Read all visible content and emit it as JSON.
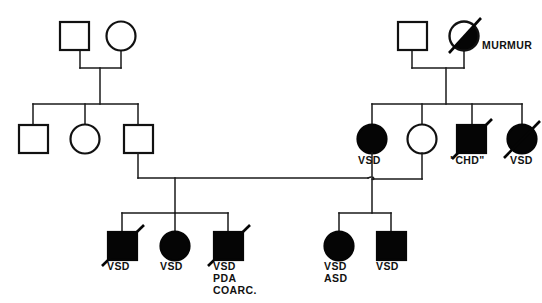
{
  "figure": {
    "type": "pedigree-chart",
    "title": "",
    "width": 542,
    "height": 303,
    "background_color": "#ffffff",
    "line_color": "#1a1a1a",
    "filled_color": "#050505"
  },
  "legend_terms": {
    "vsd": "VSD",
    "asd": "ASD",
    "pda": "PDA",
    "coarc": "COARC.",
    "chd": "\"CHD\"",
    "murmur": "MURMUR"
  },
  "generations": [
    {
      "id": "I",
      "individuals": [
        {
          "id": "I-1",
          "sex": "male",
          "shape": "square",
          "affected": "unaffected",
          "deceased": false,
          "label": ""
        },
        {
          "id": "I-2",
          "sex": "female",
          "shape": "circle",
          "affected": "unaffected",
          "deceased": false,
          "label": ""
        },
        {
          "id": "I-3",
          "sex": "male",
          "shape": "square",
          "affected": "unaffected",
          "deceased": false,
          "label": ""
        },
        {
          "id": "I-4",
          "sex": "female",
          "shape": "circle",
          "affected": "half-filled",
          "deceased": true,
          "label": "MURMUR"
        }
      ]
    },
    {
      "id": "II",
      "individuals": [
        {
          "id": "II-1",
          "sex": "male",
          "shape": "square",
          "affected": "unaffected",
          "deceased": false,
          "label": ""
        },
        {
          "id": "II-2",
          "sex": "female",
          "shape": "circle",
          "affected": "unaffected",
          "deceased": false,
          "label": ""
        },
        {
          "id": "II-3",
          "sex": "male",
          "shape": "square",
          "affected": "unaffected",
          "deceased": false,
          "label": ""
        },
        {
          "id": "II-4",
          "sex": "female",
          "shape": "circle",
          "affected": "affected",
          "deceased": false,
          "label": "VSD"
        },
        {
          "id": "II-5",
          "sex": "female",
          "shape": "circle",
          "affected": "unaffected",
          "deceased": false,
          "label": ""
        },
        {
          "id": "II-6",
          "sex": "male",
          "shape": "square",
          "affected": "affected",
          "deceased": true,
          "label": "\"CHD\""
        },
        {
          "id": "II-7",
          "sex": "female",
          "shape": "circle",
          "affected": "affected",
          "deceased": true,
          "label": "VSD"
        }
      ]
    },
    {
      "id": "III",
      "individuals": [
        {
          "id": "III-1",
          "sex": "male",
          "shape": "square",
          "affected": "affected",
          "deceased": true,
          "label": "VSD"
        },
        {
          "id": "III-2",
          "sex": "female",
          "shape": "circle",
          "affected": "affected",
          "deceased": false,
          "label": "VSD"
        },
        {
          "id": "III-3",
          "sex": "male",
          "shape": "square",
          "affected": "affected",
          "deceased": true,
          "label": "VSD\nPDA\nCOARC."
        },
        {
          "id": "III-4",
          "sex": "female",
          "shape": "circle",
          "affected": "affected",
          "deceased": false,
          "label": "VSD\nASD"
        },
        {
          "id": "III-5",
          "sex": "male",
          "shape": "square",
          "affected": "affected",
          "deceased": false,
          "label": "VSD"
        }
      ]
    }
  ],
  "labels": {
    "murmur": "MURMUR",
    "gen2_vsd": "VSD",
    "gen2_chd": "\"CHD\"",
    "gen2_vsd_right": "VSD",
    "gen3_c1": "VSD",
    "gen3_c2": "VSD",
    "gen3_c3_line1": "VSD",
    "gen3_c3_line2": "PDA",
    "gen3_c3_line3": "COARC.",
    "gen3_c4_line1": "VSD",
    "gen3_c4_line2": "ASD",
    "gen3_c5": "VSD"
  }
}
